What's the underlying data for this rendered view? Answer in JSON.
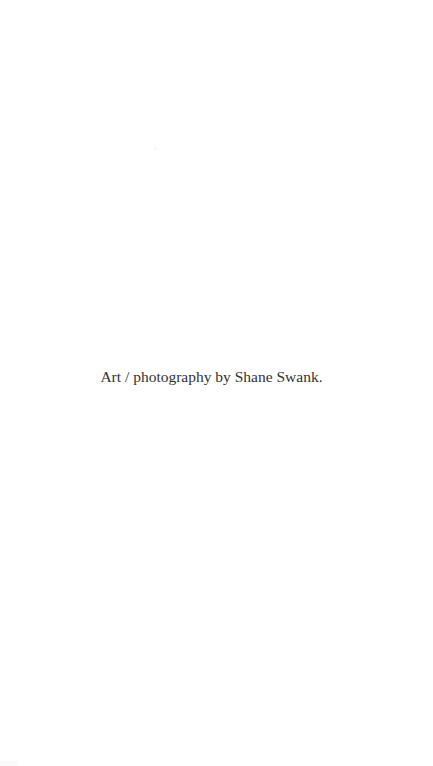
{
  "page": {
    "background_color": "#ffffff"
  },
  "credit": {
    "text": "Art / photography by Shane Swank.",
    "color": "#333333"
  }
}
